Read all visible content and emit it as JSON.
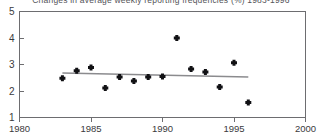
{
  "chart_data": {
    "type": "scatter",
    "title": "Changes in average weekly reporting frequencies (%) 1983-1996",
    "xlabel": "",
    "ylabel": "",
    "xlim": [
      1980,
      2000
    ],
    "ylim": [
      1,
      5
    ],
    "xticks": [
      1980,
      1985,
      1990,
      1995,
      2000
    ],
    "yticks": [
      1,
      2,
      3,
      4,
      5
    ],
    "xtick_labels": [
      "1980",
      "1985",
      "1990",
      "1995",
      "2000"
    ],
    "ytick_labels": [
      "1",
      "2",
      "3",
      "4",
      "5"
    ],
    "grid": false,
    "legend": "none",
    "marker": "filled-diamond",
    "marker_color": "#111114",
    "trend_color": "#8b8b8e",
    "axis_color": "#6d6d70",
    "x": [
      1983,
      1984,
      1985,
      1986,
      1987,
      1988,
      1989,
      1990,
      1991,
      1992,
      1993,
      1994,
      1995,
      1996
    ],
    "values": [
      2.48,
      2.76,
      2.89,
      2.11,
      2.53,
      2.38,
      2.53,
      2.55,
      4.0,
      2.83,
      2.72,
      2.15,
      3.07,
      1.57
    ],
    "series": [
      {
        "name": "average weekly reporting frequency",
        "x": [
          1983,
          1984,
          1985,
          1986,
          1987,
          1988,
          1989,
          1990,
          1991,
          1992,
          1993,
          1994,
          1995,
          1996
        ],
        "values": [
          2.48,
          2.76,
          2.89,
          2.11,
          2.53,
          2.38,
          2.53,
          2.55,
          4.0,
          2.83,
          2.72,
          2.15,
          3.07,
          1.57
        ]
      },
      {
        "name": "trend line",
        "type": "line",
        "x": [
          1983,
          1996
        ],
        "values": [
          2.68,
          2.53
        ]
      }
    ]
  }
}
